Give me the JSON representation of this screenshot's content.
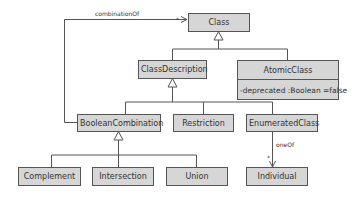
{
  "diagram": {
    "type": "UML class diagram",
    "classes": {
      "class": {
        "name": "Class"
      },
      "class_description": {
        "name": "ClassDescription"
      },
      "atomic_class": {
        "name": "AtomicClass",
        "attribute": "-deprecated :Boolean =false"
      },
      "boolean_combination": {
        "name": "BooleanCombination"
      },
      "restriction": {
        "name": "Restriction"
      },
      "enumerated_class": {
        "name": "EnumeratedClass"
      },
      "complement": {
        "name": "Complement"
      },
      "intersection": {
        "name": "Intersection"
      },
      "union": {
        "name": "Union"
      },
      "individual": {
        "name": "Individual"
      }
    },
    "associations": {
      "combination_of": {
        "label": "combinationOf",
        "multiplicity": "*"
      },
      "one_of": {
        "label": "oneOf",
        "multiplicity": "*"
      }
    },
    "generalizations": [
      {
        "child": "ClassDescription",
        "parent": "Class"
      },
      {
        "child": "AtomicClass",
        "parent": "Class"
      },
      {
        "child": "BooleanCombination",
        "parent": "ClassDescription"
      },
      {
        "child": "Restriction",
        "parent": "ClassDescription"
      },
      {
        "child": "EnumeratedClass",
        "parent": "ClassDescription"
      },
      {
        "child": "Complement",
        "parent": "BooleanCombination"
      },
      {
        "child": "Intersection",
        "parent": "BooleanCombination"
      },
      {
        "child": "Union",
        "parent": "BooleanCombination"
      }
    ],
    "colors": {
      "box_fill": "#d6d6d6",
      "box_border": "#555555",
      "line": "#555555"
    }
  }
}
